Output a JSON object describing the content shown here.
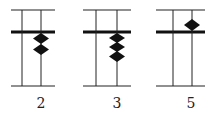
{
  "diagram": {
    "type": "abacus-place-value",
    "colors": {
      "line": "#222222",
      "bead": "#111111",
      "background": "#ffffff"
    },
    "abacuses": [
      {
        "label": "2",
        "value": 2,
        "beads_above": 0,
        "beads_below": 2
      },
      {
        "label": "3",
        "value": 3,
        "beads_above": 0,
        "beads_below": 3
      },
      {
        "label": "5",
        "value": 5,
        "beads_above": 1,
        "beads_below": 0
      }
    ]
  }
}
